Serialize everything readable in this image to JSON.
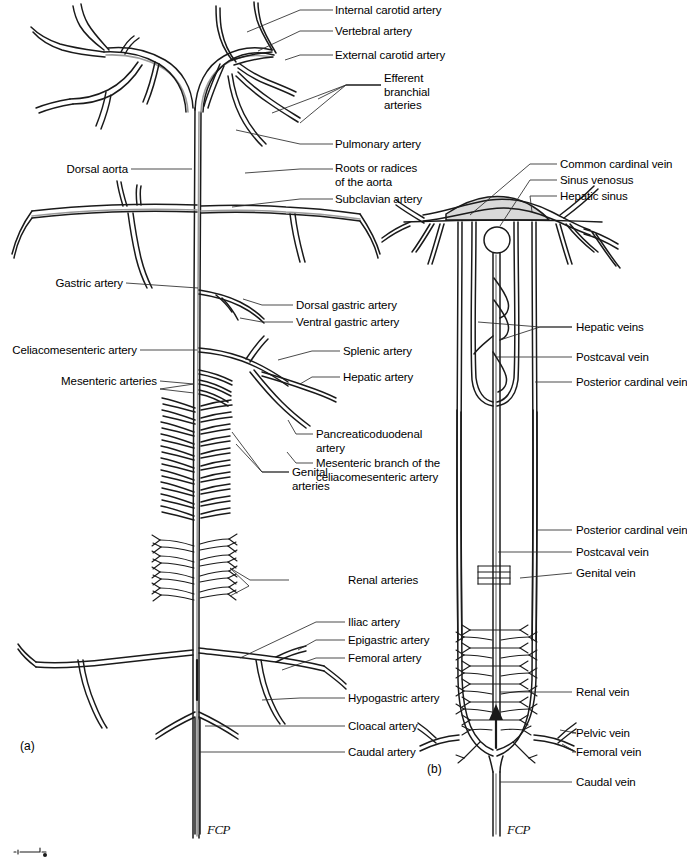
{
  "figure": {
    "panels": [
      {
        "id": "panel-a",
        "label": "(a)",
        "caption": "Arterial system"
      },
      {
        "id": "panel-b",
        "label": "(b)",
        "caption": "Venous system"
      }
    ],
    "signature": "FCP",
    "signature_b": "FCP"
  },
  "panel_a": {
    "labels_right_top": [
      {
        "key": "internal-carotid-artery",
        "text": "Internal carotid artery"
      },
      {
        "key": "vertebral-artery",
        "text": "Vertebral artery"
      },
      {
        "key": "external-carotid-artery",
        "text": "External carotid artery"
      },
      {
        "key": "efferent-branchial-arteries",
        "text": "Efferent\nbranchial\narteries"
      },
      {
        "key": "pulmonary-artery",
        "text": "Pulmonary artery"
      },
      {
        "key": "roots-or-radices-of-the-aorta",
        "text": "Roots or radices\nof the aorta"
      },
      {
        "key": "subclavian-artery",
        "text": "Subclavian artery"
      },
      {
        "key": "dorsal-gastric-artery",
        "text": "Dorsal gastric artery"
      },
      {
        "key": "ventral-gastric-artery",
        "text": "Ventral gastric artery"
      },
      {
        "key": "splenic-artery",
        "text": "Splenic artery"
      },
      {
        "key": "hepatic-artery",
        "text": "Hepatic artery"
      },
      {
        "key": "pancreaticoduodenal-artery",
        "text": "Pancreaticoduodenal\nartery"
      },
      {
        "key": "mesenteric-branch-of-the-celiacomesenteric-artery",
        "text": "Mesenteric branch of the\nceliacomesenteric artery"
      },
      {
        "key": "genital-arteries",
        "text": "Genital\narteries"
      },
      {
        "key": "renal-arteries",
        "text": "Renal arteries"
      },
      {
        "key": "iliac-artery",
        "text": "Iliac artery"
      },
      {
        "key": "epigastric-artery",
        "text": "Epigastric artery"
      },
      {
        "key": "femoral-artery",
        "text": "Femoral artery"
      },
      {
        "key": "hypogastric-artery",
        "text": "Hypogastric artery"
      },
      {
        "key": "cloacal-artery",
        "text": "Cloacal artery"
      },
      {
        "key": "caudal-artery",
        "text": "Caudal artery"
      }
    ],
    "labels_left": [
      {
        "key": "dorsal-aorta",
        "text": "Dorsal aorta"
      },
      {
        "key": "gastric-artery",
        "text": "Gastric artery"
      },
      {
        "key": "celiacomesenteric-artery",
        "text": "Celiacomesenteric artery"
      },
      {
        "key": "mesenteric-arteries",
        "text": "Mesenteric arteries"
      }
    ]
  },
  "panel_b": {
    "labels_right": [
      {
        "key": "common-cardinal-vein",
        "text": "Common cardinal vein"
      },
      {
        "key": "sinus-venosus",
        "text": "Sinus venosus"
      },
      {
        "key": "hepatic-sinus",
        "text": "Hepatic sinus"
      },
      {
        "key": "hepatic-veins",
        "text": "Hepatic veins"
      },
      {
        "key": "postcaval-vein-upper",
        "text": "Postcaval vein"
      },
      {
        "key": "posterior-cardinal-vein-upper",
        "text": "Posterior cardinal vein"
      },
      {
        "key": "posterior-cardinal-vein-lower",
        "text": "Posterior cardinal vein"
      },
      {
        "key": "postcaval-vein-lower",
        "text": "Postcaval vein"
      },
      {
        "key": "genital-vein",
        "text": "Genital vein"
      },
      {
        "key": "renal-vein",
        "text": "Renal vein"
      },
      {
        "key": "pelvic-vein",
        "text": "Pelvic vein"
      },
      {
        "key": "femoral-vein",
        "text": "Femoral vein"
      },
      {
        "key": "caudal-vein",
        "text": "Caudal vein"
      }
    ]
  },
  "colors": {
    "ink": "#1a1a1a",
    "vessel_fill": "#ffffff",
    "vessel_shade": "#8e8e8e",
    "sinus_fill": "#d8d8d8",
    "leader": "#2a2a2a",
    "background": "#ffffff"
  }
}
